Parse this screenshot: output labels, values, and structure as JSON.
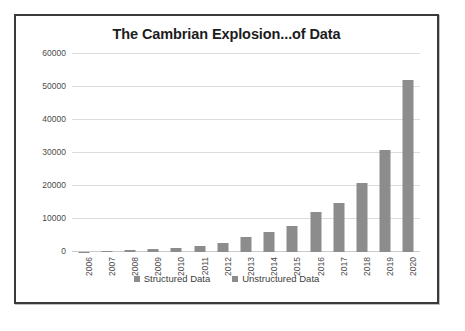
{
  "chart_data": {
    "type": "bar",
    "title": "The Cambrian Explosion...of Data",
    "xlabel": "",
    "ylabel": "Exabytes (billions of GB)",
    "categories": [
      "2006",
      "2007",
      "2008",
      "2009",
      "2010",
      "2011",
      "2012",
      "2013",
      "2014",
      "2015",
      "2016",
      "2017",
      "2018",
      "2019",
      "2020"
    ],
    "series": [
      {
        "name": "Unstructured Data",
        "values": [
          130,
          260,
          480,
          800,
          1200,
          1800,
          2800,
          4400,
          6000,
          8000,
          12000,
          15000,
          21000,
          31000,
          52000
        ]
      }
    ],
    "legend": [
      {
        "label": "Structured Data",
        "color": "#8c8c8c"
      },
      {
        "label": "Unstructured Data",
        "color": "#8c8c8c"
      }
    ],
    "ylim": [
      0,
      60000
    ],
    "yticks": [
      0,
      10000,
      20000,
      30000,
      40000,
      50000,
      60000
    ],
    "ytick_labels": [
      "0",
      "10000",
      "20000",
      "30000",
      "40000",
      "50000",
      "60000"
    ],
    "grid": true,
    "legend_position": "bottom",
    "bar_color": "#8c8c8c",
    "gridline_color": "#dcdcdc",
    "title_color": "#1c1c1c",
    "panel_border_color": "#3a3a3a"
  }
}
